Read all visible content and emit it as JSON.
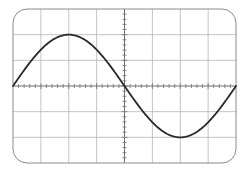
{
  "diagram": {
    "type": "oscilloscope-graticule",
    "frame": {
      "x": 13,
      "y": 9,
      "width": 223,
      "height": 154,
      "corner_radius": 14,
      "stroke": "#8a8a8a"
    },
    "grid": {
      "h_divisions": 8,
      "v_divisions": 6,
      "minor_ticks_per_division": 5,
      "grid_color": "#b5b5b5",
      "axis_color": "#6e6e6e"
    },
    "trace": {
      "waveform": "sine",
      "cycles": 1,
      "amplitude_divisions": 2,
      "phase": "starts at zero rising",
      "color": "#2a2a2a",
      "stroke_width": 1.8
    }
  },
  "chart_data": {
    "type": "line",
    "title": "",
    "xlabel": "",
    "ylabel": "",
    "x": [
      0,
      1,
      2,
      3,
      4,
      5,
      6,
      7,
      8
    ],
    "series": [
      {
        "name": "sine",
        "values": [
          0,
          1.41,
          2,
          1.41,
          0,
          -1.41,
          -2,
          -1.41,
          0
        ]
      }
    ],
    "xlim": [
      0,
      8
    ],
    "ylim": [
      -3,
      3
    ],
    "grid": true
  }
}
